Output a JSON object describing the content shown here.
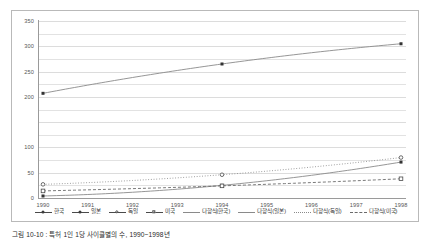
{
  "caption": "그림 10-10 : 특허 1인 1당 사이클별의 수, 1990~1998년",
  "chart_data": {
    "type": "line",
    "title": "",
    "xlabel": "",
    "ylabel": "",
    "x": [
      1990,
      1991,
      1992,
      1993,
      1994,
      1995,
      1996,
      1997,
      1998
    ],
    "xtick_labels": [
      "1990",
      "1991",
      "1992",
      "1993",
      "1994",
      "1995",
      "1996",
      "1997",
      "1998"
    ],
    "ylim": [
      0,
      350
    ],
    "ytick_values": [
      0,
      50,
      100,
      150,
      200,
      250,
      300,
      350
    ],
    "ytick_labels": [
      "0",
      "50",
      "100",
      "150",
      "200",
      "250",
      "300",
      "350"
    ],
    "ytick_labels_shown": [
      "0",
      "50",
      "100",
      "",
      "200",
      "250",
      "300",
      "350"
    ],
    "grid": true,
    "grid_minor_step": 25,
    "legend_position": "bottom",
    "series": [
      {
        "name": "한국",
        "marker": "filled-square",
        "linestyle": "solid",
        "color": "#4a4a4a",
        "points": [
          {
            "x": 1990,
            "y": 4
          },
          {
            "x": 1994,
            "y": 25
          },
          {
            "x": 1998,
            "y": 71
          }
        ]
      },
      {
        "name": "일본",
        "marker": "filled-square",
        "linestyle": "solid",
        "color": "#5a5a5a",
        "points": [
          {
            "x": 1990,
            "y": 207
          },
          {
            "x": 1994,
            "y": 265
          },
          {
            "x": 1998,
            "y": 305
          }
        ]
      },
      {
        "name": "독일",
        "marker": "open-circle",
        "linestyle": "solid",
        "color": "#6a6a6a",
        "points": [
          {
            "x": 1990,
            "y": 27
          },
          {
            "x": 1994,
            "y": 46
          },
          {
            "x": 1998,
            "y": 80
          }
        ]
      },
      {
        "name": "미국",
        "marker": "open-square",
        "linestyle": "solid",
        "color": "#6a6a6a",
        "points": [
          {
            "x": 1990,
            "y": 14
          },
          {
            "x": 1994,
            "y": 24
          },
          {
            "x": 1998,
            "y": 38
          }
        ]
      }
    ],
    "trendlines": [
      {
        "name": "다항식(한국)",
        "linestyle": "solid",
        "color": "#8a8a8a"
      },
      {
        "name": "다항식(일본)",
        "linestyle": "solid",
        "color": "#8a8a8a"
      },
      {
        "name": "다항식(독일)",
        "linestyle": "dotted",
        "color": "#8a8a8a"
      },
      {
        "name": "다항식(미국)",
        "linestyle": "dashed",
        "color": "#6a6a6a"
      }
    ],
    "legend": [
      {
        "label": "한국",
        "marker": "filled-square",
        "linestyle": "solid"
      },
      {
        "label": "일본",
        "marker": "filled-square",
        "linestyle": "solid"
      },
      {
        "label": "독일",
        "marker": "open-circle",
        "linestyle": "solid"
      },
      {
        "label": "미국",
        "marker": "open-square",
        "linestyle": "solid"
      },
      {
        "label": "다항식(한국)",
        "marker": "none",
        "linestyle": "solid"
      },
      {
        "label": "다항식(일본)",
        "marker": "none",
        "linestyle": "solid"
      },
      {
        "label": "다항식(독일)",
        "marker": "none",
        "linestyle": "dotted"
      },
      {
        "label": "다항식(미국)",
        "marker": "none",
        "linestyle": "dashed"
      }
    ]
  },
  "colors": {
    "frame": "#b9b9b9",
    "grid": "#e2e2e2",
    "axis": "#9a9a9a",
    "text": "#555555",
    "background": "#ffffff"
  }
}
